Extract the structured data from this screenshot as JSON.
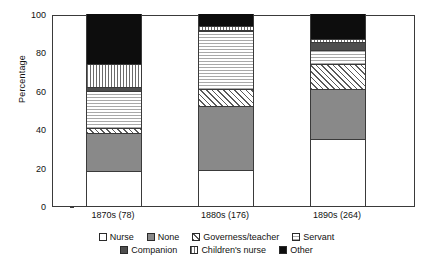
{
  "chart_data": {
    "type": "bar",
    "title": "",
    "subtitle": "",
    "xlabel": "",
    "ylabel": "Percentage",
    "ylim": [
      0,
      100
    ],
    "yticks": [
      0,
      20,
      40,
      60,
      80,
      100
    ],
    "ytick_labels": [
      "0",
      "20",
      "40",
      "60",
      "80",
      "100"
    ],
    "grid": false,
    "stacked": true,
    "orientation": "vertical",
    "legend_position": "bottom",
    "categories": [
      "1870s (78)",
      "1880s (176)",
      "1890s (264)"
    ],
    "series": [
      {
        "name": "Nurse",
        "pattern": "solid-white",
        "values": [
          18.0,
          19.0,
          35.0
        ]
      },
      {
        "name": "None",
        "pattern": "solid-gray",
        "values": [
          20.0,
          33.0,
          26.0
        ]
      },
      {
        "name": "Governess/teacher",
        "pattern": "diagonal-hatch",
        "values": [
          2.5,
          9.0,
          13.0
        ]
      },
      {
        "name": "Servant",
        "pattern": "horizontal-hatch",
        "values": [
          19.5,
          30.0,
          7.5
        ]
      },
      {
        "name": "Companion",
        "pattern": "solid-dark-gray",
        "values": [
          2.0,
          0.5,
          4.0
        ]
      },
      {
        "name": "Children's nurse",
        "pattern": "vertical-hatch",
        "values": [
          12.0,
          2.0,
          1.5
        ]
      },
      {
        "name": "Other",
        "pattern": "solid-black",
        "values": [
          26.0,
          6.5,
          13.0
        ]
      }
    ]
  },
  "axis": {
    "y_title": "Percentage",
    "y_tick_labels": [
      "100",
      "80",
      "60",
      "40",
      "20",
      "0"
    ],
    "x_tick_labels": [
      "1870s (78)",
      "1880s (176)",
      "1890s (264)"
    ]
  },
  "legend": {
    "row1": [
      {
        "label": "Nurse",
        "swatch": "legend-swatch-nurse"
      },
      {
        "label": "None",
        "swatch": "legend-swatch-none"
      },
      {
        "label": "Governess/teacher",
        "swatch": "legend-swatch-governess"
      },
      {
        "label": "Servant",
        "swatch": "legend-swatch-servant"
      }
    ],
    "row2": [
      {
        "label": "Companion",
        "swatch": "legend-swatch-companion"
      },
      {
        "label": "Children's nurse",
        "swatch": "legend-swatch-childrens-nurse"
      },
      {
        "label": "Other",
        "swatch": "legend-swatch-other"
      }
    ]
  },
  "colors": {
    "axis": "#3a3a3a",
    "text": "#111111",
    "none_fill": "#898989",
    "companion_fill": "#4e4e4e",
    "other_fill": "#0d0d0d",
    "servant_fill": "#f2f2f2",
    "background": "#ffffff"
  }
}
